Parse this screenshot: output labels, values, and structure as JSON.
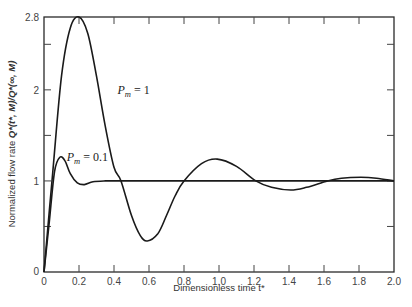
{
  "chart_data": {
    "type": "line",
    "title": "",
    "xlabel": "Dimensionless time t*",
    "ylabel": "Normalized flow rate Q*(t*, M)/Q*(∞, M)",
    "xlim": [
      0,
      2.0
    ],
    "ylim": [
      0,
      2.8
    ],
    "grid": false,
    "legend": "inline labels",
    "x_ticks": [
      "0",
      "0.2",
      "0.4",
      "0.6",
      "0.8",
      "1.0",
      "1.2",
      "1.4",
      "1.6",
      "1.8",
      "2.0"
    ],
    "y_ticks": [
      "0",
      "1",
      "2",
      "2.8"
    ],
    "y_minor_ticks": [
      0.5,
      1.5,
      2.5
    ],
    "series": [
      {
        "name": "P_m = 1",
        "label_pos": [
          0.42,
          1.95
        ],
        "x": [
          0,
          0.05,
          0.1,
          0.15,
          0.2,
          0.25,
          0.3,
          0.35,
          0.4,
          0.44,
          0.5,
          0.55,
          0.59,
          0.65,
          0.7,
          0.75,
          0.8,
          0.9,
          0.99,
          1.1,
          1.21,
          1.3,
          1.41,
          1.5,
          1.62,
          1.7,
          1.81,
          1.9,
          2.0
        ],
        "values": [
          0,
          1.1,
          2.15,
          2.68,
          2.8,
          2.62,
          2.15,
          1.6,
          1.15,
          1.0,
          0.62,
          0.4,
          0.34,
          0.42,
          0.62,
          0.84,
          1.0,
          1.19,
          1.24,
          1.16,
          1.0,
          0.93,
          0.9,
          0.93,
          1.0,
          1.03,
          1.04,
          1.03,
          1.0
        ]
      },
      {
        "name": "P_m = 0.1",
        "label_pos": [
          0.13,
          1.22
        ],
        "x": [
          0,
          0.03,
          0.06,
          0.09,
          0.12,
          0.15,
          0.19,
          0.23,
          0.28,
          0.35,
          0.45,
          0.6,
          0.8,
          1.0,
          1.5,
          2.0
        ],
        "values": [
          0,
          0.55,
          1.1,
          1.26,
          1.22,
          1.08,
          0.98,
          0.96,
          0.99,
          1.0,
          1.0,
          1.0,
          1.0,
          1.0,
          1.0,
          1.0
        ]
      }
    ],
    "reference_line": {
      "y": 1.0,
      "from_x": 0.44,
      "to_x": 2.0
    }
  },
  "labels": {
    "xlabel": "Dimensionless time t*",
    "ylabel_prefix": "Normalized flow rate ",
    "ylabel_formula": "Q*(t*, M)/Q*(∞, M)",
    "series_1_main": "P",
    "series_1_sub": "m",
    "series_1_rest": " = 1",
    "series_2_main": "P",
    "series_2_sub": "m",
    "series_2_rest": " = 0.1"
  }
}
